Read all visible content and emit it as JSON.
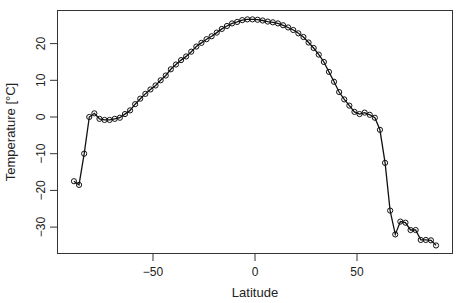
{
  "chart_data": {
    "type": "line",
    "title": "",
    "xlabel": "Latitude",
    "ylabel": "Temperature [°C]",
    "xlim": [
      -91,
      91
    ],
    "ylim": [
      -37,
      29
    ],
    "x_ticks": [
      -50,
      0,
      50
    ],
    "x_tick_labels": [
      "−50",
      "0",
      "50"
    ],
    "y_ticks": [
      -30,
      -20,
      -10,
      0,
      10,
      20
    ],
    "y_tick_labels": [
      "−30",
      "−20",
      "−10",
      "0",
      "10",
      "20"
    ],
    "grid": false,
    "legend": null,
    "marker": "open-circle",
    "series": [
      {
        "name": "Temperature",
        "x": [
          -88.75,
          -86.25,
          -83.75,
          -81.25,
          -78.75,
          -76.25,
          -73.75,
          -71.25,
          -68.75,
          -66.25,
          -63.75,
          -61.25,
          -58.75,
          -56.25,
          -53.75,
          -51.25,
          -48.75,
          -46.25,
          -43.75,
          -41.25,
          -38.75,
          -36.25,
          -33.75,
          -31.25,
          -28.75,
          -26.25,
          -23.75,
          -21.25,
          -18.75,
          -16.25,
          -13.75,
          -11.25,
          -8.75,
          -6.25,
          -3.75,
          -1.25,
          1.25,
          3.75,
          6.25,
          8.75,
          11.25,
          13.75,
          16.25,
          18.75,
          21.25,
          23.75,
          26.25,
          28.75,
          31.25,
          33.75,
          36.25,
          38.75,
          41.25,
          43.75,
          46.25,
          48.75,
          51.25,
          53.75,
          56.25,
          58.75,
          61.25,
          63.75,
          66.25,
          68.75,
          71.25,
          73.75,
          76.25,
          78.75,
          81.25,
          83.75,
          86.25,
          88.75
        ],
        "y": [
          -17.5,
          -18.5,
          -10,
          0,
          1,
          -0.5,
          -0.8,
          -0.8,
          -0.5,
          -0.2,
          0.8,
          1.8,
          3.5,
          5,
          6.3,
          7.5,
          8.6,
          10,
          11.3,
          13,
          14.3,
          15.5,
          16.5,
          17.8,
          19.2,
          20.2,
          21.2,
          22,
          23,
          24,
          24.8,
          25.5,
          25.9,
          26.4,
          26.6,
          26.6,
          26.5,
          26.3,
          26,
          25.8,
          25.5,
          25,
          24.4,
          23.7,
          22.8,
          21.8,
          20.3,
          18.8,
          17,
          15,
          12.3,
          9.6,
          6.8,
          4.8,
          3.1,
          1.4,
          0.8,
          1.2,
          0.6,
          -0.2,
          -3.5,
          -12.5,
          -25.5,
          -32,
          -28.5,
          -28.8,
          -30.8,
          -30.8,
          -33.5,
          -33.5,
          -33.6,
          -35
        ]
      }
    ]
  }
}
